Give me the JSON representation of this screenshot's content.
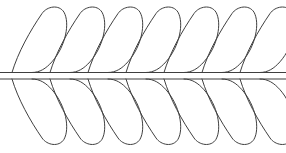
{
  "figure": {
    "background_color": "#ffffff",
    "stroke_color": "#3f3f3f",
    "width": 286,
    "height": 153
  },
  "spine": {
    "name": "double-line-spine",
    "top_line_y": 72.5,
    "bottom_line_y": 79.0,
    "x_start": 0,
    "x_end": 286,
    "stroke_width": 1.15
  },
  "leaf_geometry": {
    "count_top": 7,
    "count_bottom": 7,
    "spacing_x": 38,
    "first_tip_x": 12,
    "leaf_width": 57,
    "leaf_height": 67,
    "lean": "right",
    "top_leaf_base_y": 72.5,
    "top_leaf_apex_y": 6,
    "bottom_leaf_base_y": 79.0,
    "bottom_leaf_apex_y": 146
  },
  "leaves_top": [
    {
      "name": "leaf-top-1",
      "tip_x": 12
    },
    {
      "name": "leaf-top-2",
      "tip_x": 50
    },
    {
      "name": "leaf-top-3",
      "tip_x": 88
    },
    {
      "name": "leaf-top-4",
      "tip_x": 126
    },
    {
      "name": "leaf-top-5",
      "tip_x": 164
    },
    {
      "name": "leaf-top-6",
      "tip_x": 202
    },
    {
      "name": "leaf-top-7",
      "tip_x": 240
    }
  ],
  "leaves_bottom": [
    {
      "name": "leaf-bottom-1",
      "tip_x": 12
    },
    {
      "name": "leaf-bottom-2",
      "tip_x": 50
    },
    {
      "name": "leaf-bottom-3",
      "tip_x": 88
    },
    {
      "name": "leaf-bottom-4",
      "tip_x": 126
    },
    {
      "name": "leaf-bottom-5",
      "tip_x": 164
    },
    {
      "name": "leaf-bottom-6",
      "tip_x": 202
    },
    {
      "name": "leaf-bottom-7",
      "tip_x": 240
    }
  ]
}
